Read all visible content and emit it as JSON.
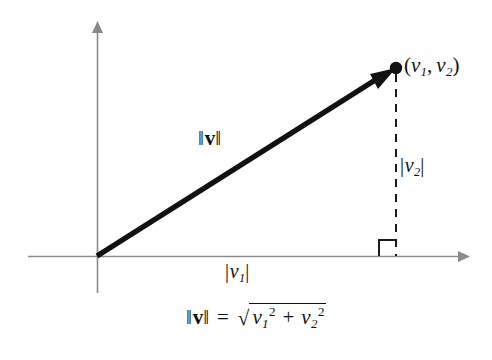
{
  "figure": {
    "type": "vector-magnitude-diagram",
    "background_color": "#ffffff",
    "ink_color": "#111111",
    "axis_color": "#8a8a8a",
    "vector_color": "#111111"
  },
  "axes": {
    "x_axis_name": "horizontal-axis",
    "y_axis_name": "vertical-axis",
    "origin_x": 97,
    "origin_y": 256,
    "x_axis_start": 28,
    "x_axis_end": 466,
    "y_axis_top": 25,
    "y_axis_bottom": 293,
    "arrowheads": [
      "x-positive",
      "y-positive"
    ]
  },
  "vector": {
    "from_x": 97,
    "from_y": 256,
    "to_x": 393,
    "to_y": 69,
    "stroke_width": 5,
    "has_arrowhead": true,
    "endpoint_dot": true
  },
  "dashed_line": {
    "x": 396,
    "from_y": 72,
    "to_y": 256,
    "dash": "8 7"
  },
  "right_angle_marker": {
    "x": 379,
    "y": 239,
    "size": 16
  },
  "labels": {
    "point": {
      "open_paren": "(",
      "v": "v",
      "sub1": "1",
      "comma": ",",
      "v2": "v",
      "sub2": "2",
      "close_paren": ")"
    },
    "norm_on_vector": {
      "bar_left": "‖",
      "v": "v",
      "bar_right": "‖"
    },
    "v2_magnitude": {
      "bar_left": "|",
      "v": "v",
      "sub": "2",
      "bar_right": "|"
    },
    "v1_magnitude": {
      "bar_left": "|",
      "v": "v",
      "sub": "1",
      "bar_right": "|"
    }
  },
  "formula": {
    "norm_bar_left": "‖",
    "norm_v": "v",
    "norm_bar_right": "‖",
    "equals": "=",
    "radical_sign": "√",
    "term1_base": "v",
    "term1_sub": "1",
    "term1_sup": "2",
    "plus": "+",
    "term2_base": "v",
    "term2_sub": "2",
    "term2_sup": "2",
    "plain_text": "‖v‖ = √(v₁² + v₂²)"
  }
}
